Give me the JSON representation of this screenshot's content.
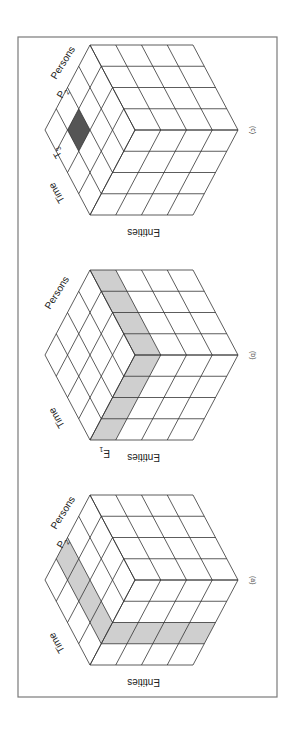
{
  "figure": {
    "frame": {
      "x": 18,
      "y": 37,
      "width": 259,
      "height": 660
    },
    "colors": {
      "light_shade": "#cfcfcf",
      "dark_shade": "#555555",
      "grid_line": "#333333",
      "frame": "#7a7a7a"
    },
    "cube_geometry": {
      "divisions": 4,
      "left": [
        45,
        130
      ],
      "top": [
        90,
        45
      ],
      "bottom": [
        90,
        215
      ],
      "center": [
        135,
        130
      ],
      "top_right": [
        193,
        45
      ],
      "right": [
        238,
        130
      ],
      "bottom_right": [
        193,
        215
      ]
    },
    "axes": {
      "time": "Time",
      "persons": "Persons",
      "entities": "Entities"
    },
    "panels": [
      {
        "caption": "(c)",
        "offset_y": 0,
        "slice_label": {
          "axis": "persons_and_time",
          "persons_label": "P",
          "persons_sub": "2",
          "time_label": "T",
          "time_sub": "3"
        },
        "highlight": {
          "type": "cell",
          "face": "top",
          "i": [
            1,
            2
          ],
          "j": [
            1,
            2
          ],
          "shade": "dark"
        }
      },
      {
        "caption": "(b)",
        "offset_y": 225,
        "slice_label": {
          "axis": "entities",
          "entities_label": "E",
          "entities_sub": "1"
        },
        "highlight": {
          "type": "entity-slice",
          "k": [
            0,
            1
          ],
          "shade": "light"
        }
      },
      {
        "caption": "(a)",
        "offset_y": 450,
        "slice_label": {
          "axis": "persons",
          "persons_label": "P",
          "persons_sub": "2"
        },
        "highlight": {
          "type": "person-slice",
          "i": [
            1,
            2
          ],
          "shade": "light"
        }
      }
    ]
  }
}
